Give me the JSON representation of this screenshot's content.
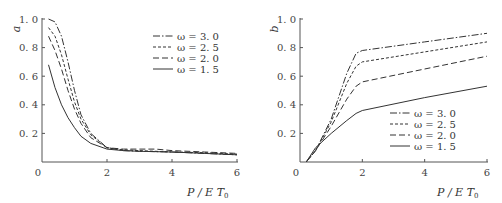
{
  "chart_data": [
    {
      "type": "line",
      "panel": "left",
      "title": "",
      "xlabel": "P/ET0",
      "ylabel": "a",
      "xlim": [
        0,
        6
      ],
      "ylim": [
        0,
        1.0
      ],
      "xticks": [
        "0",
        "2",
        "4",
        "6"
      ],
      "yticks": [
        "0.2",
        "0.4",
        "0.6",
        "0.8",
        "1.0"
      ],
      "grid": false,
      "legend_position": "upper right",
      "series": [
        {
          "name": "ω=3.0",
          "style": "dash-dot",
          "x": [
            0.2,
            0.4,
            0.6,
            0.8,
            1.0,
            1.2,
            1.5,
            2.0,
            2.5,
            3.0,
            4.0,
            5.0,
            6.0
          ],
          "values": [
            1.0,
            0.98,
            0.88,
            0.7,
            0.5,
            0.33,
            0.2,
            0.1,
            0.08,
            0.075,
            0.07,
            0.06,
            0.05
          ]
        },
        {
          "name": "ω=2.5",
          "style": "short-dash",
          "x": [
            0.2,
            0.4,
            0.6,
            0.8,
            1.0,
            1.2,
            1.5,
            2.0,
            2.5,
            3.0,
            4.0,
            5.0,
            6.0
          ],
          "values": [
            0.94,
            0.88,
            0.75,
            0.58,
            0.42,
            0.3,
            0.19,
            0.1,
            0.085,
            0.08,
            0.07,
            0.065,
            0.055
          ]
        },
        {
          "name": "ω=2.0",
          "style": "dash",
          "x": [
            0.2,
            0.4,
            0.6,
            0.8,
            1.0,
            1.2,
            1.5,
            2.0,
            2.5,
            3.0,
            3.5,
            4.0,
            5.0,
            6.0
          ],
          "values": [
            0.88,
            0.78,
            0.65,
            0.5,
            0.37,
            0.27,
            0.17,
            0.1,
            0.09,
            0.09,
            0.09,
            0.08,
            0.07,
            0.06
          ]
        },
        {
          "name": "ω=1.5",
          "style": "solid",
          "x": [
            0.2,
            0.4,
            0.6,
            0.8,
            1.0,
            1.2,
            1.5,
            2.0,
            2.5,
            3.0,
            4.0,
            5.0,
            6.0
          ],
          "values": [
            0.68,
            0.52,
            0.4,
            0.31,
            0.24,
            0.18,
            0.13,
            0.09,
            0.08,
            0.075,
            0.07,
            0.06,
            0.05
          ]
        }
      ]
    },
    {
      "type": "line",
      "panel": "right",
      "title": "",
      "xlabel": "P/ET0",
      "ylabel": "b",
      "xlim": [
        0,
        6
      ],
      "ylim": [
        0,
        1.0
      ],
      "xticks": [
        "0",
        "2",
        "4",
        "6"
      ],
      "yticks": [
        "0.2",
        "0.4",
        "0.6",
        "0.8",
        "1.0"
      ],
      "grid": false,
      "legend_position": "lower right",
      "series": [
        {
          "name": "ω=3.0",
          "style": "dash-dot",
          "x": [
            0.2,
            0.5,
            1.0,
            1.5,
            1.8,
            2.0,
            4.0,
            6.0
          ],
          "values": [
            0.0,
            0.08,
            0.3,
            0.62,
            0.76,
            0.78,
            0.84,
            0.9
          ]
        },
        {
          "name": "ω=2.5",
          "style": "short-dash",
          "x": [
            0.2,
            0.5,
            1.0,
            1.5,
            1.8,
            2.0,
            4.0,
            6.0
          ],
          "values": [
            0.0,
            0.08,
            0.28,
            0.55,
            0.67,
            0.7,
            0.77,
            0.84
          ]
        },
        {
          "name": "ω=2.0",
          "style": "dash",
          "x": [
            0.2,
            0.5,
            1.0,
            1.5,
            1.8,
            2.0,
            4.0,
            6.0
          ],
          "values": [
            0.0,
            0.08,
            0.25,
            0.44,
            0.53,
            0.56,
            0.65,
            0.74
          ]
        },
        {
          "name": "ω=1.5",
          "style": "solid",
          "x": [
            0.2,
            0.5,
            1.0,
            1.5,
            1.8,
            2.0,
            4.0,
            6.0
          ],
          "values": [
            0.0,
            0.1,
            0.2,
            0.29,
            0.34,
            0.36,
            0.45,
            0.53
          ]
        }
      ]
    }
  ],
  "panels": {
    "left": {
      "ylabel": "a",
      "xlabel_main": "P/ET",
      "xlabel_sub": "0",
      "origin": "0"
    },
    "right": {
      "ylabel": "b",
      "xlabel_main": "P/ET",
      "xlabel_sub": "0",
      "origin": "0"
    }
  }
}
